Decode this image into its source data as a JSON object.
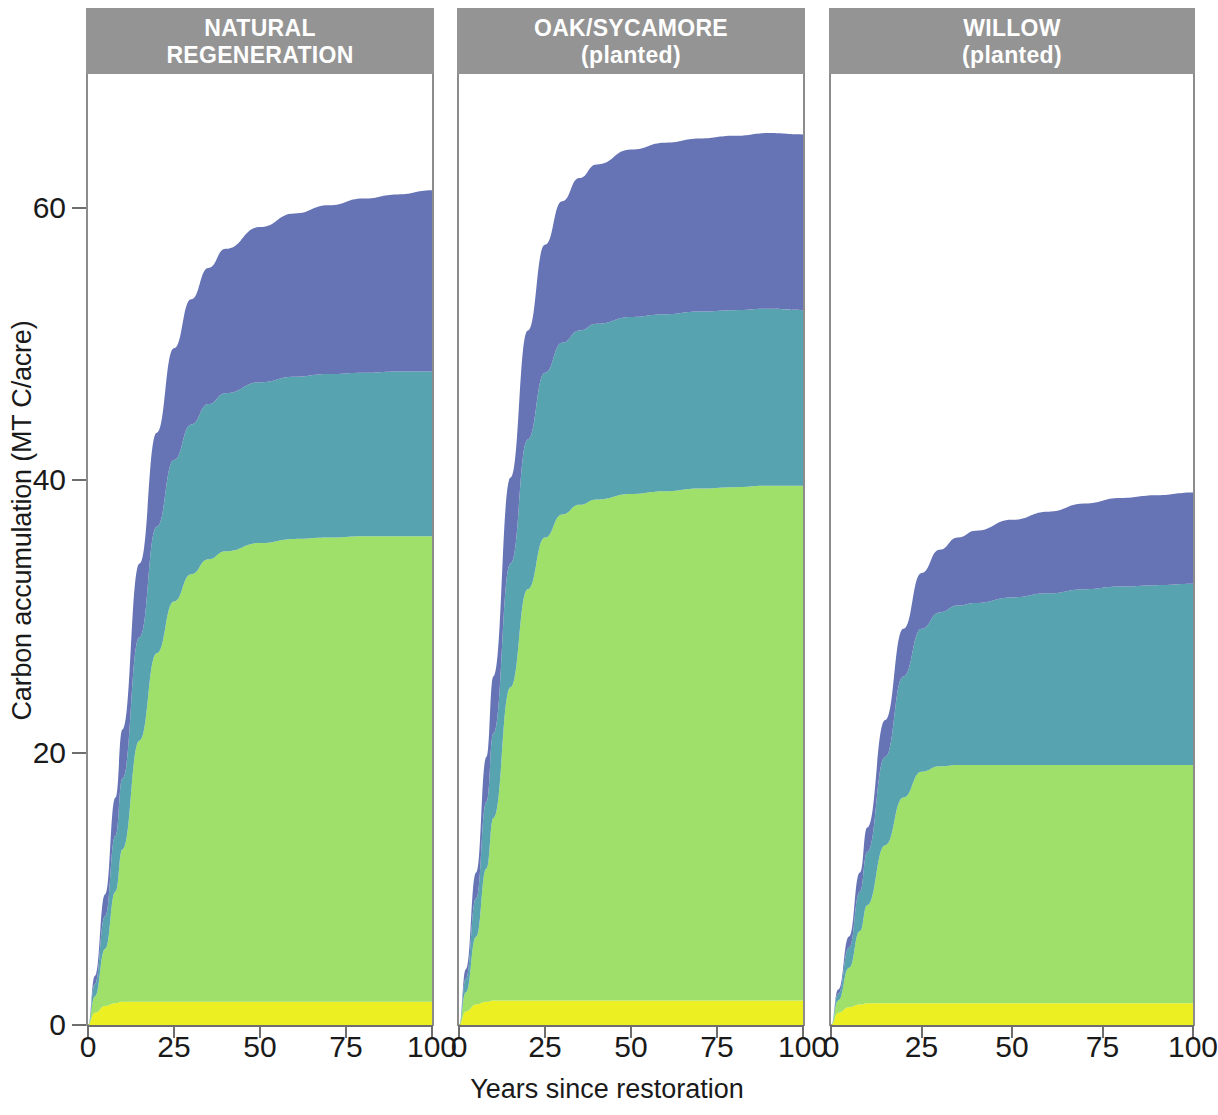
{
  "figure": {
    "ylabel": "Carbon accumulation (MT C/acre)",
    "xlabel": "Years since restoration"
  },
  "chart_data": {
    "type": "area",
    "title": "",
    "xlabel": "Years since restoration",
    "ylabel": "Carbon accumulation (MT C/acre)",
    "xlim": [
      0,
      100
    ],
    "ylim": [
      0,
      70
    ],
    "xticks": [
      0,
      25,
      50,
      75,
      100
    ],
    "yticks": [
      0,
      20,
      40,
      60
    ],
    "xtick_labels": [
      "0",
      "25",
      "50",
      "75",
      "100"
    ],
    "ytick_labels": [
      "0",
      "20",
      "40",
      "60"
    ],
    "grid": false,
    "legend": "none",
    "stacked": true,
    "layer_colors": [
      "#ecef22",
      "#9fe06a",
      "#58a3b0",
      "#6673b5"
    ],
    "layer_names": [
      "understory",
      "aboveground-live-tree",
      "standing-dead-and-down-wood",
      "soil-organic-carbon"
    ],
    "x": [
      0,
      2,
      5,
      8,
      10,
      15,
      20,
      25,
      30,
      35,
      40,
      50,
      60,
      70,
      80,
      90,
      100
    ],
    "panels": [
      {
        "title_line1": "NATURAL",
        "title_line2": "REGENERATION",
        "series": [
          {
            "name": "understory",
            "color": "#ecef22",
            "values": [
              0.0,
              0.9,
              1.4,
              1.6,
              1.7,
              1.7,
              1.7,
              1.7,
              1.7,
              1.7,
              1.7,
              1.7,
              1.7,
              1.7,
              1.7,
              1.7,
              1.7
            ]
          },
          {
            "name": "aboveground-live-tree",
            "color": "#9fe06a",
            "values": [
              0.0,
              1.2,
              4.2,
              8.2,
              11.2,
              19.2,
              25.6,
              29.4,
              31.4,
              32.5,
              33.1,
              33.7,
              34.0,
              34.1,
              34.2,
              34.2,
              34.2
            ]
          },
          {
            "name": "standing-dead-and-down-wood",
            "color": "#58a3b0",
            "values": [
              0.0,
              0.9,
              2.4,
              4.1,
              5.2,
              7.6,
              9.3,
              10.4,
              11.0,
              11.4,
              11.6,
              11.8,
              11.9,
              12.0,
              12.0,
              12.1,
              12.1
            ]
          },
          {
            "name": "soil-organic-carbon",
            "color": "#6673b5",
            "values": [
              0.0,
              0.6,
              1.6,
              2.8,
              3.6,
              5.4,
              6.9,
              8.2,
              9.2,
              10.0,
              10.6,
              11.4,
              12.0,
              12.4,
              12.8,
              13.0,
              13.3
            ]
          }
        ],
        "total_at_100": 61.3
      },
      {
        "title_line1": "OAK/SYCAMORE",
        "title_line2": "(planted)",
        "series": [
          {
            "name": "understory",
            "color": "#ecef22",
            "values": [
              0.0,
              1.0,
              1.5,
              1.7,
              1.8,
              1.8,
              1.8,
              1.8,
              1.8,
              1.8,
              1.8,
              1.8,
              1.8,
              1.8,
              1.8,
              1.8,
              1.8
            ]
          },
          {
            "name": "aboveground-live-tree",
            "color": "#9fe06a",
            "values": [
              0.0,
              1.4,
              5.0,
              9.8,
              13.4,
              23.0,
              30.2,
              34.0,
              35.7,
              36.4,
              36.8,
              37.2,
              37.4,
              37.6,
              37.7,
              37.8,
              37.8
            ]
          },
          {
            "name": "standing-dead-and-down-wood",
            "color": "#58a3b0",
            "values": [
              0.0,
              1.0,
              2.8,
              4.9,
              6.2,
              9.1,
              11.0,
              12.1,
              12.6,
              12.8,
              12.9,
              13.0,
              13.0,
              13.0,
              13.0,
              13.0,
              12.9
            ]
          },
          {
            "name": "soil-organic-carbon",
            "color": "#6673b5",
            "values": [
              0.0,
              0.7,
              1.9,
              3.3,
              4.2,
              6.3,
              8.0,
              9.4,
              10.4,
              11.2,
              11.7,
              12.3,
              12.6,
              12.7,
              12.8,
              12.9,
              12.9
            ]
          }
        ],
        "total_at_100": 65.4
      },
      {
        "title_line1": "WILLOW",
        "title_line2": "(planted)",
        "series": [
          {
            "name": "understory",
            "color": "#ecef22",
            "values": [
              0.0,
              0.9,
              1.3,
              1.5,
              1.6,
              1.6,
              1.6,
              1.6,
              1.6,
              1.6,
              1.6,
              1.6,
              1.6,
              1.6,
              1.6,
              1.6,
              1.6
            ]
          },
          {
            "name": "aboveground-live-tree",
            "color": "#9fe06a",
            "values": [
              0.0,
              0.9,
              2.9,
              5.4,
              7.2,
              11.6,
              15.1,
              17.0,
              17.4,
              17.5,
              17.5,
              17.5,
              17.5,
              17.5,
              17.5,
              17.5,
              17.5
            ]
          },
          {
            "name": "standing-dead-and-down-wood",
            "color": "#58a3b0",
            "values": [
              0.0,
              0.5,
              1.5,
              2.9,
              3.9,
              6.5,
              8.9,
              10.5,
              11.3,
              11.7,
              11.9,
              12.3,
              12.6,
              12.9,
              13.1,
              13.2,
              13.3
            ]
          },
          {
            "name": "soil-organic-carbon",
            "color": "#6673b5",
            "values": [
              0.0,
              0.3,
              0.8,
              1.4,
              1.8,
              2.7,
              3.5,
              4.1,
              4.6,
              5.0,
              5.3,
              5.7,
              6.0,
              6.3,
              6.5,
              6.6,
              6.7
            ]
          }
        ],
        "total_at_100": 39.1
      }
    ]
  }
}
